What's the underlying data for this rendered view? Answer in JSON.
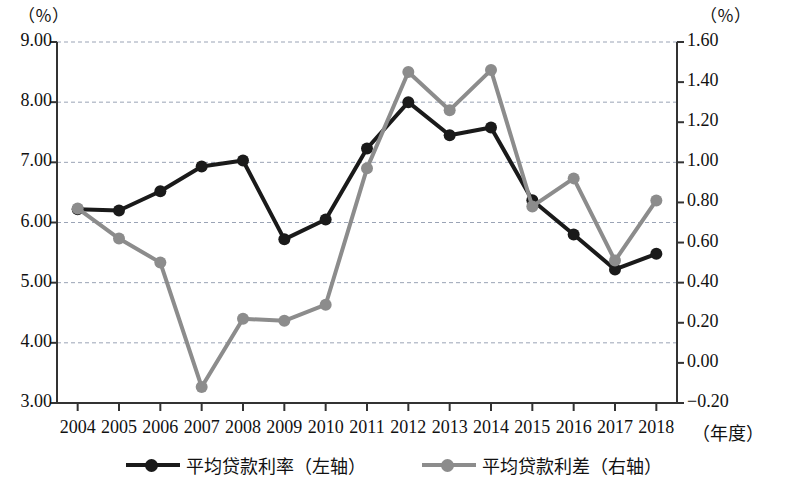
{
  "chart_data": {
    "type": "line",
    "title": "",
    "xlabel": "（年度）",
    "ylabel_left": "（％）",
    "ylabel_right": "（％）",
    "grid": true,
    "legend_position": "bottom",
    "categories": [
      "2004",
      "2005",
      "2006",
      "2007",
      "2008",
      "2009",
      "2010",
      "2011",
      "2012",
      "2013",
      "2014",
      "2015",
      "2016",
      "2017",
      "2018"
    ],
    "left_axis": {
      "unit": "（％）",
      "min": 3.0,
      "max": 9.0,
      "step": 1.0,
      "ticks": [
        "3.00",
        "4.00",
        "5.00",
        "6.00",
        "7.00",
        "8.00",
        "9.00"
      ]
    },
    "right_axis": {
      "unit": "（％）",
      "min": -0.2,
      "max": 1.6,
      "step": 0.2,
      "ticks": [
        "-0.20",
        "0.00",
        "0.20",
        "0.40",
        "0.60",
        "0.80",
        "1.00",
        "1.20",
        "1.40",
        "1.60"
      ]
    },
    "series": [
      {
        "name": "平均贷款利率（左轴）",
        "axis": "left",
        "color": "#1a1a1a",
        "values": [
          6.22,
          6.2,
          6.52,
          6.93,
          7.03,
          5.72,
          6.05,
          7.23,
          8.0,
          7.45,
          7.58,
          6.37,
          5.8,
          5.22,
          5.48
        ]
      },
      {
        "name": "平均贷款利差（右轴）",
        "axis": "right",
        "color": "#8c8c8c",
        "values": [
          0.77,
          0.62,
          0.5,
          -0.12,
          0.22,
          0.21,
          0.29,
          0.97,
          1.45,
          1.26,
          1.46,
          0.78,
          0.92,
          0.51,
          0.81
        ]
      }
    ]
  },
  "legend": {
    "items": [
      {
        "label": "平均贷款利率（左轴）",
        "color": "#1a1a1a"
      },
      {
        "label": "平均贷款利差（右轴）",
        "color": "#8c8c8c"
      }
    ]
  },
  "axis_titles": {
    "left_unit": "（％）",
    "right_unit": "（％）",
    "x_title": "（年度）"
  }
}
